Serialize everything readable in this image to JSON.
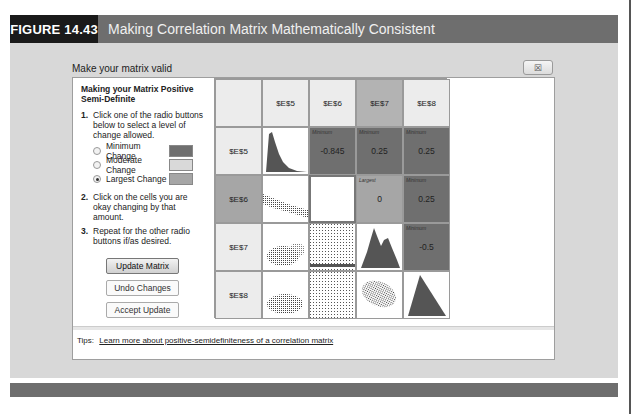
{
  "figure": {
    "label": "FIGURE 14.43",
    "title": "Making Correlation Matrix Mathematically Consistent"
  },
  "dialog": {
    "title": "Make your matrix valid",
    "close_icon": "close-x-icon"
  },
  "instructions": {
    "heading": "Making your Matrix Positive Semi-Definite",
    "steps": [
      {
        "num": "1.",
        "text": "Click one of the radio buttons below to select a level of change allowed."
      },
      {
        "num": "2.",
        "text": "Click on the cells you are okay changing by that amount."
      },
      {
        "num": "3.",
        "text": "Repeat for the other radio buttons if/as desired."
      }
    ],
    "options": [
      {
        "label": "Minimum Change",
        "color": "#6f6f6f",
        "checked": false
      },
      {
        "label": "Moderate Change",
        "color": "#d9d9d9",
        "checked": false
      },
      {
        "label": "Largest Change",
        "color": "#a6a6a6",
        "checked": true
      }
    ]
  },
  "buttons": {
    "update": "Update Matrix",
    "undo": "Undo Changes",
    "accept": "Accept Update"
  },
  "matrix": {
    "col_headers": [
      "$E$5",
      "$E$6",
      "$E$7",
      "$E$8"
    ],
    "row_headers": [
      "$E$5",
      "$E$6",
      "$E$7",
      "$E$8"
    ],
    "cells": {
      "r0c1": {
        "tag": "Minimum",
        "value": "-0.845"
      },
      "r0c2": {
        "tag": "Minimum",
        "value": "0.25"
      },
      "r0c3": {
        "tag": "Minimum",
        "value": "0.25"
      },
      "r1c2": {
        "tag": "Largest",
        "value": "0"
      },
      "r1c3": {
        "tag": "Minimum",
        "value": "0.25"
      },
      "r2c3": {
        "tag": "Minimum",
        "value": "-0.5"
      }
    }
  },
  "tips": {
    "label": "Tips:",
    "link": "Learn more about positive-semidefiniteness of a correlation matrix"
  }
}
